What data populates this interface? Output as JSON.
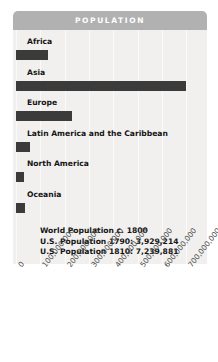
{
  "header": {
    "title": "POPULATION"
  },
  "annotation": {
    "lines": [
      "World Population c. 1800",
      "U.S. Population 1790: 3,929,214",
      "U.S. Population 1810: 7,239,881"
    ]
  },
  "colors": {
    "header_bar": "#b1b1b1",
    "plot_background": "#f1f0ee",
    "gridline": "#fafafa",
    "bar": "#3b3b3b",
    "label_text": "#151515",
    "title_text": "#ffffff",
    "tick_text": "#4a4a4a"
  },
  "chart_data": {
    "type": "bar",
    "orientation": "horizontal",
    "title": "POPULATION",
    "xlabel": "",
    "ylabel": "",
    "categories": [
      "Africa",
      "Asia",
      "Europe",
      "Latin America and the Caribbean",
      "North America",
      "Oceania"
    ],
    "values": [
      130000000,
      700000000,
      230000000,
      57000000,
      33000000,
      37000000
    ],
    "xlim": [
      0,
      800000000
    ],
    "tick_labels": [
      "0",
      "100,000,000",
      "200,000,000",
      "300,000,000",
      "400,000,000",
      "500,000,000",
      "600,000,000",
      "700,000,000"
    ],
    "tick_values": [
      0,
      100000000,
      200000000,
      300000000,
      400000000,
      500000000,
      600000000,
      700000000
    ],
    "grid": true,
    "grid_orientation": "vertical",
    "legend": null,
    "annotations": [
      "World Population c. 1800",
      "U.S. Population 1790: 3,929,214",
      "U.S. Population 1810: 7,239,881"
    ]
  }
}
